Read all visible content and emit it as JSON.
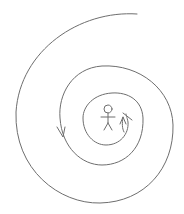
{
  "diagram": {
    "colors": {
      "background": "#ffffff",
      "stroke": "#6e6e6e"
    },
    "elements": [
      {
        "name": "spiral",
        "type": "path"
      },
      {
        "name": "stick-figure",
        "type": "figure"
      },
      {
        "name": "arrow-left",
        "type": "arrow",
        "direction": "down"
      },
      {
        "name": "arrow-inner",
        "type": "arrow",
        "direction": "up"
      }
    ]
  }
}
